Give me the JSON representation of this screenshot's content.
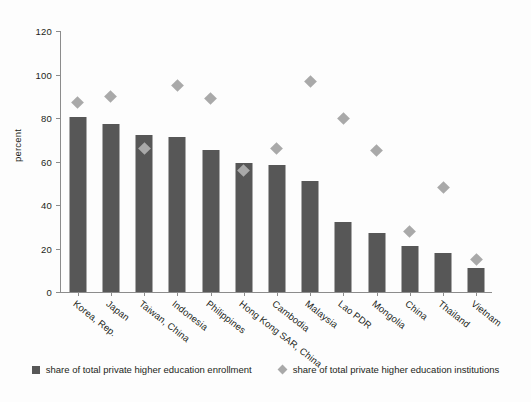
{
  "chart_data": {
    "type": "bar",
    "title": "",
    "xlabel": "",
    "ylabel": "percent",
    "ylim": [
      0,
      120
    ],
    "yticks": [
      0,
      20,
      40,
      60,
      80,
      100,
      120
    ],
    "grid": false,
    "legend_position": "bottom",
    "categories": [
      "Korea, Rep.",
      "Japan",
      "Taiwan, China",
      "Indonesia",
      "Philippines",
      "Hong Kong SAR, China",
      "Cambodia",
      "Malaysia",
      "Lao PDR",
      "Mongolia",
      "China",
      "Thailand",
      "Vietnam"
    ],
    "series": [
      {
        "name": "share of total private higher education enrollment",
        "type": "bar",
        "color": "#575757",
        "values": [
          80,
          77,
          72,
          71,
          65,
          59,
          58,
          51,
          32,
          27,
          21,
          18,
          11
        ]
      },
      {
        "name": "share of total private higher education institutions",
        "type": "scatter",
        "marker": "diamond",
        "color": "#a9a9a9",
        "values": [
          87,
          90,
          66,
          95,
          89,
          56,
          66,
          97,
          80,
          65,
          28,
          48,
          15
        ]
      }
    ]
  },
  "legend": {
    "entries": [
      {
        "label": "share of total private higher education enrollment",
        "icon": "square-swatch"
      },
      {
        "label": "share of total private higher education institutions",
        "icon": "diamond-swatch"
      }
    ]
  }
}
